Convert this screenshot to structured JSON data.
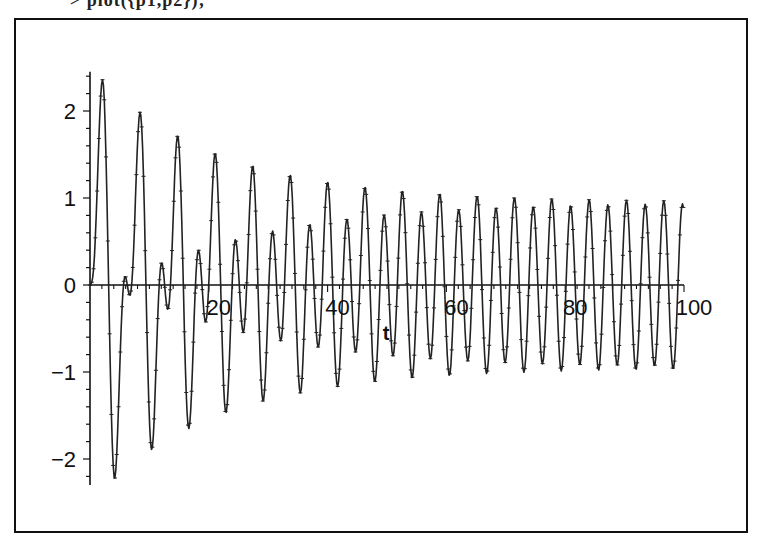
{
  "caption": "> plot({p1,p2});",
  "chart_data": {
    "type": "line",
    "title": "",
    "xlabel": "t",
    "ylabel": "",
    "xlim": [
      0,
      100
    ],
    "ylim": [
      -2.3,
      2.45
    ],
    "grid": false,
    "legend": null,
    "x_ticks": [
      20,
      40,
      60,
      80,
      100
    ],
    "x_tick_labels": [
      "20",
      "40",
      "60",
      "80",
      "100"
    ],
    "y_ticks": [
      -2,
      -1,
      0,
      1,
      2
    ],
    "y_tick_labels": [
      "-2",
      "-1",
      "0",
      "1",
      "2"
    ],
    "line_color": "#222222",
    "marker": "point-plus",
    "model": {
      "form": "y = a*exp(-k*t)*sin(t) + b*sin(2*t)",
      "a": 1.95,
      "k": 0.045,
      "b": -0.95
    },
    "samples": {
      "step": 0.15,
      "t_start": 0,
      "t_end": 100
    },
    "key_points": [
      {
        "t": 2.2,
        "y": 2.38,
        "note": "global max"
      },
      {
        "t": 3.9,
        "y": -2.2,
        "note": "global min"
      },
      {
        "t": 5.7,
        "y": 0.2
      },
      {
        "t": 6.9,
        "y": -0.15
      },
      {
        "t": 8.4,
        "y": 1.9
      },
      {
        "t": 10.0,
        "y": -1.78
      },
      {
        "t": 14.8,
        "y": 1.58
      },
      {
        "t": 16.3,
        "y": -1.5
      },
      {
        "t": 21.0,
        "y": 1.4
      },
      {
        "t": 27.0,
        "y": 1.25
      },
      {
        "t": 60.0,
        "y": 1.0
      },
      {
        "t": 100.0,
        "y": 0.95
      }
    ]
  },
  "axes": {
    "t_label": "t",
    "zero_label": "0"
  }
}
